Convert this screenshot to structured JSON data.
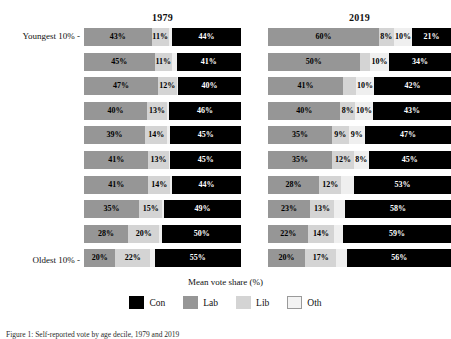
{
  "chart_data": {
    "type": "bar",
    "orientation": "horizontal",
    "stacked": true,
    "title": "",
    "xlabel": "Mean vote share (%)",
    "ylabel": "",
    "xlim": [
      0,
      100
    ],
    "grid": false,
    "legend_position": "bottom",
    "legend": [
      "Con",
      "Lab",
      "Lib",
      "Oth"
    ],
    "series_colors": {
      "Con": "#000000",
      "Lab": "#969696",
      "Lib": "#d4d4d4",
      "Oth": "#efefef"
    },
    "segment_order": [
      "Lab",
      "Lib",
      "Oth",
      "Con"
    ],
    "ytick_labels": [
      "Youngest 10% -",
      "Oldest 10% -"
    ],
    "categories": [
      "Youngest 10%",
      "2nd decile",
      "3rd decile",
      "4th decile",
      "5th decile",
      "6th decile",
      "7th decile",
      "8th decile",
      "9th decile",
      "Oldest 10%"
    ],
    "panels": [
      {
        "title": "1979",
        "rows": [
          {
            "Lab": 43,
            "Lib": 11,
            "Oth": 2,
            "Con": 44
          },
          {
            "Lab": 45,
            "Lib": 11,
            "Oth": 3,
            "Con": 41
          },
          {
            "Lab": 47,
            "Lib": 12,
            "Oth": 1,
            "Con": 40
          },
          {
            "Lab": 40,
            "Lib": 13,
            "Oth": 1,
            "Con": 46
          },
          {
            "Lab": 39,
            "Lib": 14,
            "Oth": 2,
            "Con": 45
          },
          {
            "Lab": 41,
            "Lib": 13,
            "Oth": 1,
            "Con": 45
          },
          {
            "Lab": 41,
            "Lib": 14,
            "Oth": 1,
            "Con": 44
          },
          {
            "Lab": 35,
            "Lib": 15,
            "Oth": 1,
            "Con": 49
          },
          {
            "Lab": 28,
            "Lib": 20,
            "Oth": 2,
            "Con": 50
          },
          {
            "Lab": 20,
            "Lib": 22,
            "Oth": 3,
            "Con": 55
          }
        ]
      },
      {
        "title": "2019",
        "rows": [
          {
            "Lab": 60,
            "Lib": 8,
            "Oth": 10,
            "Con": 21
          },
          {
            "Lab": 50,
            "Lib": 6,
            "Oth": 10,
            "Con": 34
          },
          {
            "Lab": 41,
            "Lib": 7,
            "Oth": 10,
            "Con": 42
          },
          {
            "Lab": 40,
            "Lib": 8,
            "Oth": 10,
            "Con": 43
          },
          {
            "Lab": 35,
            "Lib": 9,
            "Oth": 9,
            "Con": 47
          },
          {
            "Lab": 35,
            "Lib": 12,
            "Oth": 8,
            "Con": 45
          },
          {
            "Lab": 28,
            "Lib": 12,
            "Oth": 7,
            "Con": 53
          },
          {
            "Lab": 23,
            "Lib": 13,
            "Oth": 6,
            "Con": 58
          },
          {
            "Lab": 22,
            "Lib": 14,
            "Oth": 5,
            "Con": 59
          },
          {
            "Lab": 20,
            "Lib": 17,
            "Oth": 6,
            "Con": 56
          }
        ]
      }
    ],
    "data_labels": {
      "1979": [
        [
          {
            "s": "Lab",
            "t": "43%"
          },
          {
            "s": "Lib",
            "t": "11%"
          },
          {
            "s": "Con",
            "t": "44%"
          }
        ],
        [
          {
            "s": "Lab",
            "t": "45%"
          },
          {
            "s": "Lib",
            "t": "11%"
          },
          {
            "s": "Con",
            "t": "41%"
          }
        ],
        [
          {
            "s": "Lab",
            "t": "47%"
          },
          {
            "s": "Lib",
            "t": "12%"
          },
          {
            "s": "Con",
            "t": "40%"
          }
        ],
        [
          {
            "s": "Lab",
            "t": "40%"
          },
          {
            "s": "Lib",
            "t": "13%"
          },
          {
            "s": "Con",
            "t": "46%"
          }
        ],
        [
          {
            "s": "Lab",
            "t": "39%"
          },
          {
            "s": "Lib",
            "t": "14%"
          },
          {
            "s": "Con",
            "t": "45%"
          }
        ],
        [
          {
            "s": "Lab",
            "t": "41%"
          },
          {
            "s": "Lib",
            "t": "13%"
          },
          {
            "s": "Con",
            "t": "45%"
          }
        ],
        [
          {
            "s": "Lab",
            "t": "41%"
          },
          {
            "s": "Lib",
            "t": "14%"
          },
          {
            "s": "Con",
            "t": "44%"
          }
        ],
        [
          {
            "s": "Lab",
            "t": "35%"
          },
          {
            "s": "Lib",
            "t": "15%"
          },
          {
            "s": "Con",
            "t": "49%"
          }
        ],
        [
          {
            "s": "Lab",
            "t": "28%"
          },
          {
            "s": "Lib",
            "t": "20%"
          },
          {
            "s": "Con",
            "t": "50%"
          }
        ],
        [
          {
            "s": "Lab",
            "t": "20%"
          },
          {
            "s": "Lib",
            "t": "22%"
          },
          {
            "s": "Con",
            "t": "55%"
          }
        ]
      ],
      "2019": [
        [
          {
            "s": "Lab",
            "t": "60%"
          },
          {
            "s": "Lib",
            "t": "8%"
          },
          {
            "s": "Oth",
            "t": "10%"
          },
          {
            "s": "Con",
            "t": "21%"
          }
        ],
        [
          {
            "s": "Lab",
            "t": "50%"
          },
          {
            "s": "Oth",
            "t": "10%"
          },
          {
            "s": "Con",
            "t": "34%"
          }
        ],
        [
          {
            "s": "Lab",
            "t": "41%"
          },
          {
            "s": "Oth",
            "t": "10%"
          },
          {
            "s": "Con",
            "t": "42%"
          }
        ],
        [
          {
            "s": "Lab",
            "t": "40%"
          },
          {
            "s": "Lib",
            "t": "8%"
          },
          {
            "s": "Oth",
            "t": "10%"
          },
          {
            "s": "Con",
            "t": "43%"
          }
        ],
        [
          {
            "s": "Lab",
            "t": "35%"
          },
          {
            "s": "Lib",
            "t": "9%"
          },
          {
            "s": "Oth",
            "t": "9%"
          },
          {
            "s": "Con",
            "t": "47%"
          }
        ],
        [
          {
            "s": "Lab",
            "t": "35%"
          },
          {
            "s": "Lib",
            "t": "12%"
          },
          {
            "s": "Oth",
            "t": "8%"
          },
          {
            "s": "Con",
            "t": "45%"
          }
        ],
        [
          {
            "s": "Lab",
            "t": "28%"
          },
          {
            "s": "Lib",
            "t": "12%"
          },
          {
            "s": "Con",
            "t": "53%"
          }
        ],
        [
          {
            "s": "Lab",
            "t": "23%"
          },
          {
            "s": "Lib",
            "t": "13%"
          },
          {
            "s": "Con",
            "t": "58%"
          }
        ],
        [
          {
            "s": "Lab",
            "t": "22%"
          },
          {
            "s": "Lib",
            "t": "14%"
          },
          {
            "s": "Con",
            "t": "59%"
          }
        ],
        [
          {
            "s": "Lab",
            "t": "20%"
          },
          {
            "s": "Lib",
            "t": "17%"
          },
          {
            "s": "Con",
            "t": "56%"
          }
        ]
      ]
    }
  },
  "caption": "Figure 1: Self-reported vote by age decile, 1979 and 2019"
}
